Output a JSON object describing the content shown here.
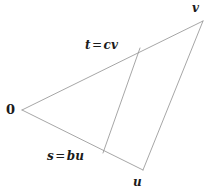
{
  "figure": {
    "kind": "geometry-diagram",
    "background_color": "#ffffff",
    "line_color": "#8f8f8f",
    "text_color": "#1b1b1b",
    "width": 211,
    "height": 196
  },
  "labels": {
    "origin": "0",
    "vertex_u": "u",
    "vertex_v": "v",
    "point_t": "t = cv",
    "point_t_lhs": "t",
    "point_t_op": "=",
    "point_t_rhs": "cv",
    "point_s": "s = bu",
    "point_s_lhs": "s",
    "point_s_op": "=",
    "point_s_rhs": "bu"
  },
  "geometry": {
    "points": {
      "origin": {
        "x": 22,
        "y": 110
      },
      "u": {
        "x": 143,
        "y": 170
      },
      "v": {
        "x": 203,
        "y": 21
      },
      "s": {
        "x": 103,
        "y": 153
      },
      "t": {
        "x": 140,
        "y": 48
      }
    },
    "segments": [
      {
        "name": "side-origin-to-v",
        "from": "origin",
        "to": "v"
      },
      {
        "name": "side-origin-to-u",
        "from": "origin",
        "to": "u"
      },
      {
        "name": "side-v-to-u",
        "from": "v",
        "to": "u"
      },
      {
        "name": "segment-s-to-t",
        "from": "s",
        "to": "t"
      }
    ]
  },
  "label_positions": {
    "origin": {
      "x": 6,
      "y": 103
    },
    "vertex_v": {
      "x": 192,
      "y": 2
    },
    "vertex_u": {
      "x": 133,
      "y": 176
    },
    "point_t": {
      "x": 85,
      "y": 39
    },
    "point_s": {
      "x": 47,
      "y": 150
    }
  }
}
